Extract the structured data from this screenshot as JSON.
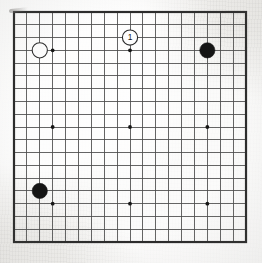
{
  "diagram": {
    "type": "go-board-diagram",
    "board_size": 19,
    "background_color": "#f2f1ef",
    "grid_color": "#4a4a4a",
    "border_color": "#2b2b2b",
    "black_color": "#141414",
    "white_color": "#fdfdfd",
    "geometry": {
      "left": 14,
      "top": 12,
      "right": 246,
      "bottom": 242,
      "cell_x": 12.89,
      "cell_y": 12.78,
      "stone_radius": 7.6,
      "star_radius": 1.9,
      "border_width": 2.2,
      "grid_width": 0.85
    },
    "star_points": [
      {
        "col": 4,
        "row": 4
      },
      {
        "col": 10,
        "row": 4
      },
      {
        "col": 16,
        "row": 4
      },
      {
        "col": 4,
        "row": 10
      },
      {
        "col": 10,
        "row": 10
      },
      {
        "col": 16,
        "row": 10
      },
      {
        "col": 4,
        "row": 16
      },
      {
        "col": 10,
        "row": 16
      },
      {
        "col": 16,
        "row": 16
      }
    ],
    "stones": [
      {
        "id": "white-stone-top-left",
        "color": "white",
        "col": 3,
        "row": 4,
        "label": "",
        "marked": false
      },
      {
        "id": "black-stone-top-right",
        "color": "black",
        "col": 16,
        "row": 4,
        "label": "",
        "marked": false
      },
      {
        "id": "black-stone-bottom-left",
        "color": "black",
        "col": 3,
        "row": 15,
        "label": "",
        "marked": false
      },
      {
        "id": "move-1-white",
        "color": "white",
        "col": 10,
        "row": 3,
        "label": "1",
        "marked": true
      }
    ],
    "move_labels": [
      {
        "text": "1",
        "col": 10,
        "row": 3,
        "stone_color": "white"
      }
    ],
    "legend": {
      "move_number": "1",
      "note": ""
    }
  }
}
